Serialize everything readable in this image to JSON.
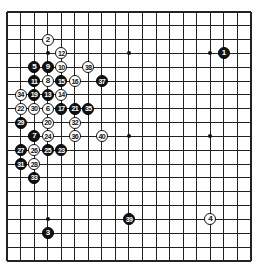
{
  "board": {
    "size": 19,
    "origin_x": 7,
    "origin_y": 12,
    "spacing_x": 13.55,
    "spacing_y": 13.83,
    "line_color": "#222222",
    "background": "#ffffff",
    "hoshi": [
      [
        3,
        3
      ],
      [
        9,
        3
      ],
      [
        15,
        3
      ],
      [
        3,
        9
      ],
      [
        9,
        9
      ],
      [
        15,
        9
      ],
      [
        3,
        15
      ],
      [
        9,
        15
      ],
      [
        15,
        15
      ]
    ]
  },
  "stones": [
    {
      "n": "1",
      "color": "black",
      "col": 16,
      "row": 3
    },
    {
      "n": "2",
      "color": "white",
      "col": 3,
      "row": 2
    },
    {
      "n": "3",
      "color": "black",
      "col": 3,
      "row": 16
    },
    {
      "n": "4",
      "color": "white",
      "col": 15,
      "row": 15
    },
    {
      "n": "5",
      "color": "black",
      "col": 2,
      "row": 4
    },
    {
      "n": "6",
      "color": "white",
      "col": 3,
      "row": 7
    },
    {
      "n": "7",
      "color": "black",
      "col": 2,
      "row": 9
    },
    {
      "n": "8",
      "color": "white",
      "col": 3,
      "row": 5
    },
    {
      "n": "9",
      "color": "black",
      "col": 3,
      "row": 4
    },
    {
      "n": "10",
      "color": "white",
      "col": 4,
      "row": 4
    },
    {
      "n": "11",
      "color": "black",
      "col": 2,
      "row": 5
    },
    {
      "n": "12",
      "color": "white",
      "col": 4,
      "row": 3
    },
    {
      "n": "13",
      "color": "black",
      "col": 3,
      "row": 6
    },
    {
      "n": "14",
      "color": "white",
      "col": 4,
      "row": 6
    },
    {
      "n": "15",
      "color": "black",
      "col": 4,
      "row": 5
    },
    {
      "n": "16",
      "color": "white",
      "col": 5,
      "row": 5
    },
    {
      "n": "17",
      "color": "black",
      "col": 4,
      "row": 7
    },
    {
      "n": "19",
      "color": "black",
      "col": 2,
      "row": 6
    },
    {
      "n": "20",
      "color": "white",
      "col": 3,
      "row": 8
    },
    {
      "n": "21",
      "color": "black",
      "col": 5,
      "row": 7
    },
    {
      "n": "22",
      "color": "white",
      "col": 1,
      "row": 7
    },
    {
      "n": "23",
      "color": "black",
      "col": 4,
      "row": 10
    },
    {
      "n": "24",
      "color": "white",
      "col": 3,
      "row": 9
    },
    {
      "n": "25",
      "color": "black",
      "col": 3,
      "row": 10
    },
    {
      "n": "26",
      "color": "white",
      "col": 2,
      "row": 10
    },
    {
      "n": "27",
      "color": "black",
      "col": 1,
      "row": 10
    },
    {
      "n": "28",
      "color": "white",
      "col": 2,
      "row": 11
    },
    {
      "n": "29",
      "color": "black",
      "col": 1,
      "row": 8
    },
    {
      "n": "30",
      "color": "white",
      "col": 2,
      "row": 7
    },
    {
      "n": "31",
      "color": "black",
      "col": 1,
      "row": 11
    },
    {
      "n": "32",
      "color": "white",
      "col": 5,
      "row": 8
    },
    {
      "n": "33",
      "color": "black",
      "col": 2,
      "row": 12
    },
    {
      "n": "34",
      "color": "white",
      "col": 1,
      "row": 6
    },
    {
      "n": "35",
      "color": "black",
      "col": 6,
      "row": 7
    },
    {
      "n": "36",
      "color": "white",
      "col": 5,
      "row": 9
    },
    {
      "n": "37",
      "color": "black",
      "col": 7,
      "row": 5
    },
    {
      "n": "38",
      "color": "white",
      "col": 6,
      "row": 4
    },
    {
      "n": "39",
      "color": "black",
      "col": 9,
      "row": 15
    },
    {
      "n": "40",
      "color": "white",
      "col": 7,
      "row": 9
    }
  ]
}
